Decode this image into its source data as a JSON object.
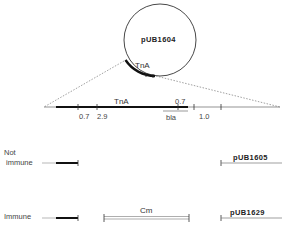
{
  "plasmid": {
    "name": "pUB1604",
    "insert_label": "TnA"
  },
  "linear_map": {
    "tna_label": "TnA",
    "segment_labels": [
      "0.7",
      "2.9",
      "0.7",
      "1.0"
    ],
    "bla_label": "bla"
  },
  "rows": [
    {
      "label_line1": "Not",
      "label_line2": "immune",
      "plasmid_label": "pUB1605"
    },
    {
      "label_line1": "Immune",
      "insert_label": "Cm",
      "plasmid_label": "pUB1629"
    }
  ]
}
